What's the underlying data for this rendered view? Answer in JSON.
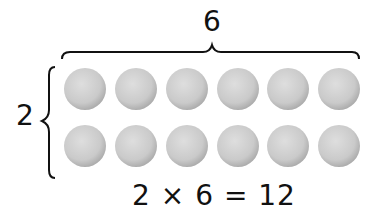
{
  "diagram": {
    "type": "array-multiplication",
    "columns_label": "6",
    "rows_label": "2",
    "equation": "2 × 6 = 12",
    "rows": 2,
    "columns": 6,
    "counter_color": "#cfcfcf",
    "counter_edge_color": "#a8a8a8",
    "brace_color": "#111111"
  }
}
